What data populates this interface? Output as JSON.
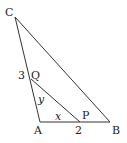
{
  "diagram": {
    "type": "triangle",
    "stroke_color": "#333333",
    "points": {
      "C": {
        "label": "C",
        "x": 15,
        "y": 17
      },
      "A": {
        "label": "A",
        "x": 40,
        "y": 122
      },
      "B": {
        "label": "B",
        "x": 110,
        "y": 122
      },
      "Q": {
        "label": "Q",
        "x": 31,
        "y": 79
      },
      "P": {
        "label": "P",
        "x": 80,
        "y": 122
      }
    },
    "segments": [
      {
        "from": "C",
        "to": "A"
      },
      {
        "from": "A",
        "to": "B"
      },
      {
        "from": "B",
        "to": "C"
      },
      {
        "from": "Q",
        "to": "P"
      }
    ],
    "annotations": {
      "CQ_length": "3",
      "PB_length": "2",
      "AP_var": "x",
      "AQ_var": "y"
    }
  }
}
